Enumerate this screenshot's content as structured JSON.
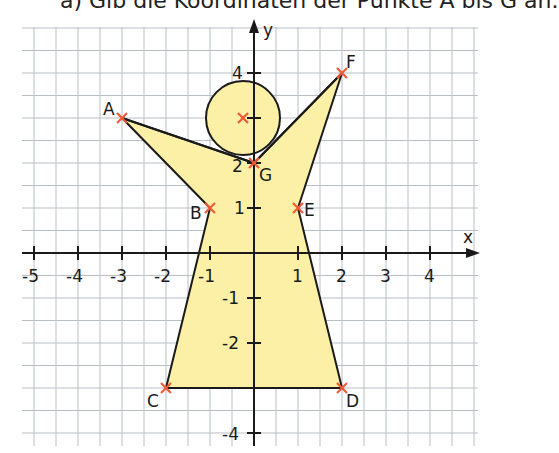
{
  "task": {
    "text": "a) Gib die Koordinaten der Punkte A bis G an."
  },
  "axes": {
    "x_label": "x",
    "y_label": "y",
    "x_ticks": [
      "-5",
      "-4",
      "-3",
      "-2",
      "-1",
      "1",
      "2",
      "3",
      "4"
    ],
    "y_ticks": [
      "4",
      "2",
      "1",
      "-1",
      "-2",
      "-4"
    ]
  },
  "points": [
    {
      "name": "A",
      "x": -3,
      "y": 3
    },
    {
      "name": "B",
      "x": -1,
      "y": 1
    },
    {
      "name": "C",
      "x": -2,
      "y": -3
    },
    {
      "name": "D",
      "x": 2,
      "y": -3
    },
    {
      "name": "E",
      "x": 1,
      "y": 1
    },
    {
      "name": "F",
      "x": 2,
      "y": 4
    },
    {
      "name": "G",
      "x": 0,
      "y": 2
    }
  ],
  "head_circle": {
    "center_x": -0.25,
    "center_y": 3,
    "radius": 0.85
  },
  "colors": {
    "fill": "#fbf0a6",
    "marker": "#ee5a36",
    "outline": "#1a1a1a",
    "grid": "#b9bec3"
  }
}
